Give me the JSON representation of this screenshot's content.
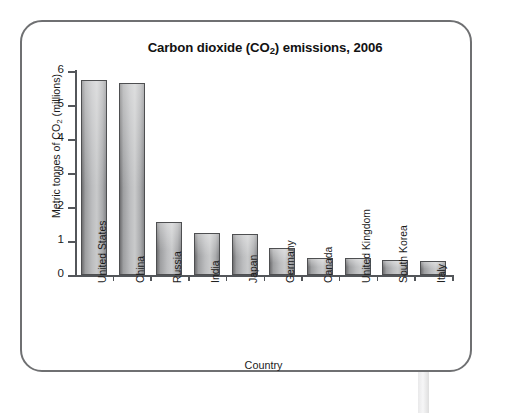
{
  "figure": {
    "frame_border_color": "#6f7072",
    "bar_fill_light": "#c9cacb",
    "bar_fill_dark": "#6e6e70",
    "axis_color": "#53565a"
  },
  "chart_data": {
    "type": "bar",
    "title": "Carbon dioxide (CO",
    "title_sub": "2",
    "title_tail": ") emissions, 2006",
    "title_full": "Carbon dioxide (CO2) emissions, 2006",
    "xlabel": "Country",
    "ylabel": "Metric tonnes of CO",
    "ylabel_sub": "2",
    "ylabel_tail": " (millions)",
    "ylabel_full": "Metric tonnes of CO2 (millions)",
    "ylim": [
      0,
      6
    ],
    "yticks": [
      0,
      1,
      2,
      3,
      4,
      5,
      6
    ],
    "ytick_labels": [
      "0",
      "1",
      "2",
      "3",
      "4",
      "5",
      "6"
    ],
    "grid": false,
    "legend": false,
    "categories": [
      "United States",
      "China",
      "Russia",
      "India",
      "Japan",
      "Germany",
      "Canada",
      "United Kingdom",
      "South Korea",
      "Italy"
    ],
    "values": [
      5.75,
      5.65,
      1.55,
      1.25,
      1.2,
      0.8,
      0.5,
      0.5,
      0.45,
      0.4
    ]
  }
}
